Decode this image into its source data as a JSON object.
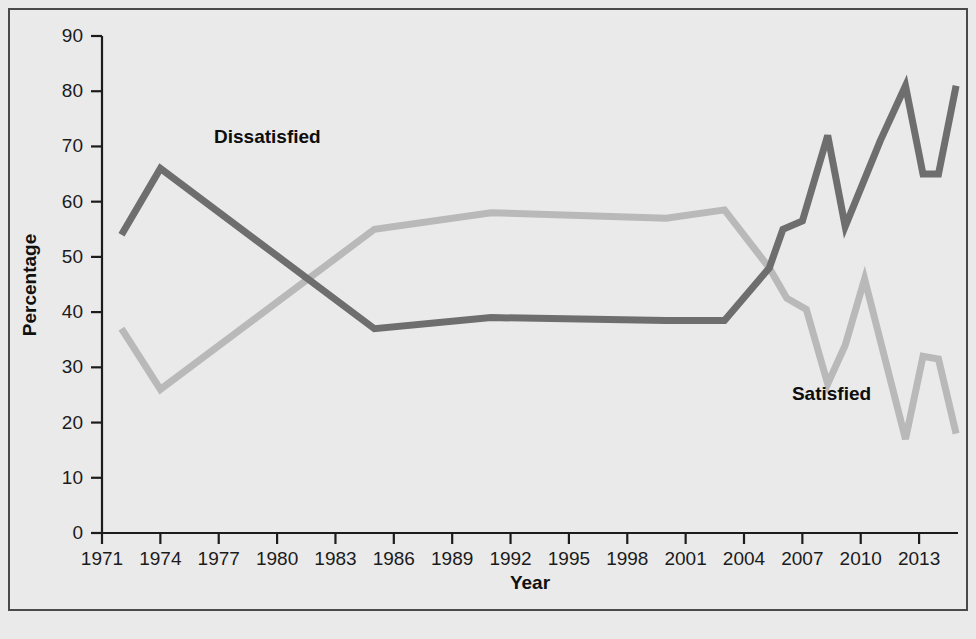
{
  "figure": {
    "background_color": "#eaeaea",
    "border_color": "#4a4a4a"
  },
  "axis_titles": {
    "x": "Year",
    "y": "Percentage"
  },
  "series_labels": {
    "dissatisfied": "Dissatisfied",
    "satisfied": "Satisfied"
  },
  "y_ticks": [
    "0",
    "10",
    "20",
    "30",
    "40",
    "50",
    "60",
    "70",
    "80",
    "90"
  ],
  "x_ticks": [
    "1971",
    "1974",
    "1977",
    "1980",
    "1983",
    "1986",
    "1989",
    "1992",
    "1995",
    "1998",
    "2001",
    "2004",
    "2007",
    "2010",
    "2013"
  ],
  "chart_data": {
    "type": "line",
    "title": "",
    "xlabel": "Year",
    "ylabel": "Percentage",
    "xlim": [
      1971,
      2015
    ],
    "ylim": [
      0,
      90
    ],
    "grid": false,
    "legend": "inline-annotations",
    "x_tick_values": [
      1971,
      1974,
      1977,
      1980,
      1983,
      1986,
      1989,
      1992,
      1995,
      1998,
      2001,
      2004,
      2007,
      2010,
      2013
    ],
    "y_tick_values": [
      0,
      10,
      20,
      30,
      40,
      50,
      60,
      70,
      80,
      90
    ],
    "series": [
      {
        "name": "Dissatisfied",
        "color": "#6e6e6e",
        "label_position": {
          "x": 1979.5,
          "y": 71.5
        },
        "points": [
          {
            "x": 1972.0,
            "y": 54
          },
          {
            "x": 1974.0,
            "y": 66
          },
          {
            "x": 1985.0,
            "y": 37
          },
          {
            "x": 1991.0,
            "y": 39
          },
          {
            "x": 2000.0,
            "y": 38.5
          },
          {
            "x": 2003.0,
            "y": 38.5
          },
          {
            "x": 2005.3,
            "y": 48
          },
          {
            "x": 2006.0,
            "y": 55
          },
          {
            "x": 2007.0,
            "y": 56.5
          },
          {
            "x": 2008.3,
            "y": 72
          },
          {
            "x": 2009.2,
            "y": 55.5
          },
          {
            "x": 2011.0,
            "y": 71
          },
          {
            "x": 2012.3,
            "y": 81
          },
          {
            "x": 2013.2,
            "y": 65
          },
          {
            "x": 2014.0,
            "y": 65
          },
          {
            "x": 2014.9,
            "y": 81
          }
        ]
      },
      {
        "name": "Satisfied",
        "color": "#b9b9b9",
        "label_position": {
          "x": 2008.5,
          "y": 25
        },
        "points": [
          {
            "x": 1972.0,
            "y": 37
          },
          {
            "x": 1974.0,
            "y": 26
          },
          {
            "x": 1985.0,
            "y": 55
          },
          {
            "x": 1991.0,
            "y": 58
          },
          {
            "x": 2000.0,
            "y": 57
          },
          {
            "x": 2003.0,
            "y": 58.5
          },
          {
            "x": 2005.3,
            "y": 48
          },
          {
            "x": 2006.2,
            "y": 42.5
          },
          {
            "x": 2007.2,
            "y": 40.5
          },
          {
            "x": 2008.3,
            "y": 27
          },
          {
            "x": 2009.2,
            "y": 34
          },
          {
            "x": 2010.2,
            "y": 46
          },
          {
            "x": 2012.3,
            "y": 17
          },
          {
            "x": 2013.2,
            "y": 32
          },
          {
            "x": 2014.0,
            "y": 31.5
          },
          {
            "x": 2014.9,
            "y": 18
          }
        ]
      }
    ]
  }
}
